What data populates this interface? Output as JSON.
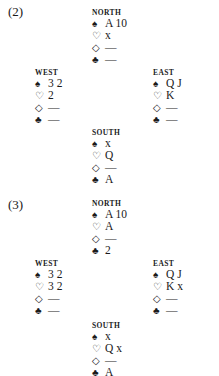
{
  "diagrams": [
    {
      "label": "(2)",
      "north": {
        "name": "NORTH",
        "spades": "A 10",
        "hearts": "x",
        "diamonds": "—",
        "clubs": "—"
      },
      "west": {
        "name": "WEST",
        "spades": "3 2",
        "hearts": "2",
        "diamonds": "—",
        "clubs": "—"
      },
      "east": {
        "name": "EAST",
        "spades": "Q J",
        "hearts": "K",
        "diamonds": "—",
        "clubs": "—"
      },
      "south": {
        "name": "SOUTH",
        "spades": "x",
        "hearts": "Q",
        "diamonds": "—",
        "clubs": "A"
      }
    },
    {
      "label": "(3)",
      "north": {
        "name": "NORTH",
        "spades": "A 10",
        "hearts": "A",
        "diamonds": "—",
        "clubs": "2"
      },
      "west": {
        "name": "WEST",
        "spades": "3 2",
        "hearts": "3 2",
        "diamonds": "—",
        "clubs": "—"
      },
      "east": {
        "name": "EAST",
        "spades": "Q J",
        "hearts": "K x",
        "diamonds": "—",
        "clubs": "—"
      },
      "south": {
        "name": "SOUTH",
        "spades": "x",
        "hearts": "Q x",
        "diamonds": "—",
        "clubs": "A"
      }
    }
  ],
  "suit_icons": {
    "spades": "♠",
    "hearts": "♡",
    "diamonds": "◇",
    "clubs": "♣"
  }
}
